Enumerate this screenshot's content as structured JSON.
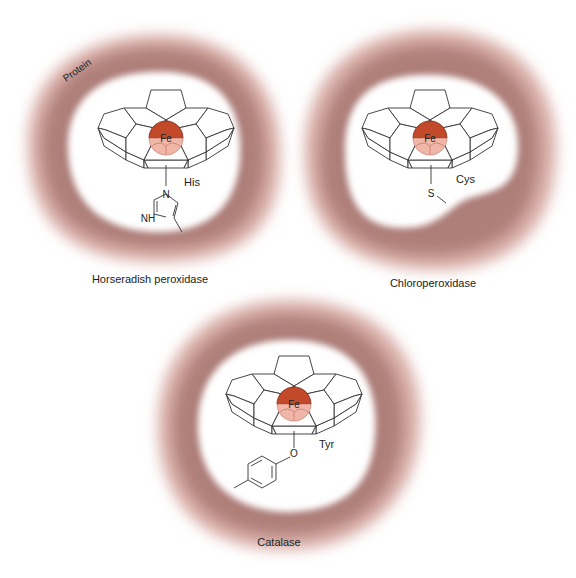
{
  "figure": {
    "protein_label": "Protein",
    "metal_label": "Fe",
    "colors": {
      "protein_outer": "#f4dcd8",
      "protein_mid": "#c99a94",
      "protein_inner": "#8c5852",
      "iron_top": "#c2492a",
      "iron_bottom": "#f0b6a8",
      "line": "#333333"
    },
    "panels": [
      {
        "enzyme": "Horseradish peroxidase",
        "ligand": "His",
        "atoms": [
          "N",
          "NH"
        ]
      },
      {
        "enzyme": "Chloroperoxidase",
        "ligand": "Cys",
        "atoms": [
          "S"
        ]
      },
      {
        "enzyme": "Catalase",
        "ligand": "Tyr",
        "atoms": [
          "O"
        ]
      }
    ]
  }
}
